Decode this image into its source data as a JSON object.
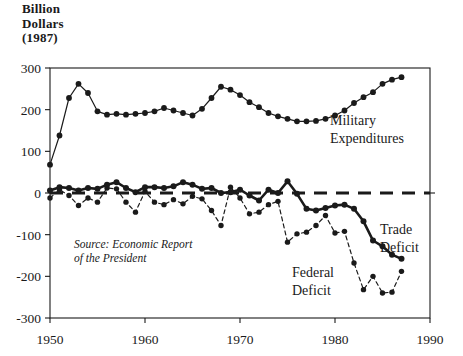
{
  "axis_title": "Billion\nDollars\n(1987)",
  "annotations": {
    "source_line1": "Source: Economic Report",
    "source_line2": "of the President"
  },
  "labels": {
    "military_line1": "Military",
    "military_line2": "Expenditures",
    "trade_line1": "Trade",
    "trade_line2": "Deficit",
    "federal_line1": "Federal",
    "federal_line2": "Deficit"
  },
  "colors": {
    "ink": "#1a1a1a",
    "background": "#ffffff"
  },
  "chart_data": {
    "type": "line",
    "xlabel": "",
    "ylabel": "Billion Dollars (1987)",
    "xlim": [
      1950,
      1990
    ],
    "ylim": [
      -300,
      300
    ],
    "xticks": [
      1950,
      1960,
      1970,
      1980,
      1990
    ],
    "xticklabels": [
      "1950",
      "1960",
      "1970",
      "1980",
      "1990"
    ],
    "yticks": [
      -300,
      -200,
      -100,
      0,
      100,
      200,
      300
    ],
    "yticklabels": [
      "-300",
      "-200",
      "-100",
      "0",
      "100",
      "200",
      "300"
    ],
    "grid": false,
    "legend": "inline-labels",
    "zero_reference_line": {
      "value": 0,
      "style": "dashed",
      "label": ""
    },
    "x": [
      1950,
      1951,
      1952,
      1953,
      1954,
      1955,
      1956,
      1957,
      1958,
      1959,
      1960,
      1961,
      1962,
      1963,
      1964,
      1965,
      1966,
      1967,
      1968,
      1969,
      1970,
      1971,
      1972,
      1973,
      1974,
      1975,
      1976,
      1977,
      1978,
      1979,
      1980,
      1981,
      1982,
      1983,
      1984,
      1985,
      1986,
      1987
    ],
    "series": [
      {
        "name": "Military Expenditures",
        "style": "solid",
        "marker": "filled-circle",
        "values": [
          68,
          138,
          228,
          262,
          240,
          196,
          188,
          190,
          188,
          190,
          192,
          196,
          204,
          198,
          192,
          186,
          202,
          228,
          255,
          248,
          235,
          218,
          206,
          192,
          184,
          178,
          172,
          172,
          173,
          178,
          186,
          198,
          216,
          230,
          242,
          262,
          272,
          278
        ]
      },
      {
        "name": "Trade Deficit",
        "style": "solid",
        "marker": "filled-circle",
        "values": [
          6,
          14,
          12,
          6,
          12,
          10,
          20,
          26,
          12,
          2,
          14,
          14,
          12,
          16,
          26,
          20,
          10,
          12,
          0,
          2,
          8,
          -6,
          -18,
          8,
          0,
          28,
          -2,
          -38,
          -42,
          -36,
          -30,
          -28,
          -38,
          -68,
          -114,
          -128,
          -148,
          -158
        ]
      },
      {
        "name": "Federal Deficit",
        "style": "dashed",
        "marker": "filled-circle",
        "values": [
          -12,
          8,
          -6,
          -30,
          -12,
          -22,
          12,
          10,
          -22,
          -46,
          4,
          -22,
          -28,
          -16,
          -26,
          -8,
          -14,
          -42,
          -78,
          14,
          -12,
          -50,
          -46,
          -28,
          -20,
          -118,
          -98,
          -94,
          -78,
          -54,
          -96,
          -92,
          -168,
          -232,
          -200,
          -240,
          -238,
          -188
        ]
      }
    ]
  }
}
